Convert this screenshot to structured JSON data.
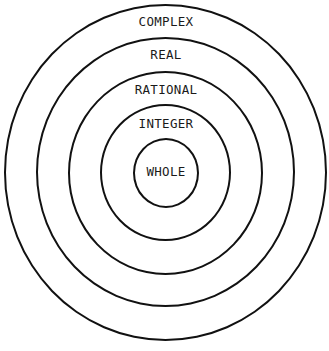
{
  "rings": [
    {
      "label": "COMPLEX",
      "left": 4,
      "top": 4,
      "width": 323,
      "height": 337,
      "label_y": 16
    },
    {
      "label": "REAL",
      "left": 36,
      "top": 37,
      "width": 195,
      "height": 204,
      "label_y": 49
    },
    {
      "label": "RATIONAL",
      "left": 68,
      "top": 71,
      "width": 195,
      "height": 204,
      "label_y": 84
    },
    {
      "label": "INTEGER",
      "left": 100,
      "top": 104,
      "width": 195,
      "height": 204,
      "label_y": 118
    },
    {
      "label": "WHOLE",
      "left": 133,
      "top": 138,
      "width": 66,
      "height": 70,
      "label_y": 166
    }
  ],
  "labels": {
    "complex": "COMPLEX",
    "real": "REAL",
    "rational": "RATIONAL",
    "integer": "INTEGER",
    "whole": "WHOLE"
  },
  "colors": {
    "stroke": "#111111",
    "text": "#1a1a1a",
    "background": "#ffffff"
  }
}
